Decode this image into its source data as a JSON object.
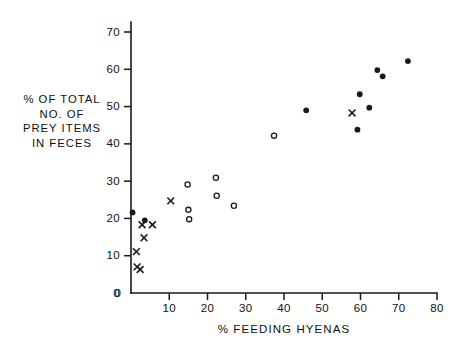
{
  "chart_data": {
    "type": "scatter",
    "title": "",
    "xlabel": "% FEEDING HYENAS",
    "ylabel_lines": [
      "% OF TOTAL",
      "NO. OF",
      "PREY ITEMS",
      "IN FECES"
    ],
    "ylabel": "% OF TOTAL NO. OF PREY ITEMS IN FECES",
    "xlim": [
      0,
      80
    ],
    "ylim": [
      0,
      73
    ],
    "xticks": [
      0,
      10,
      20,
      30,
      40,
      50,
      60,
      70,
      80
    ],
    "xtick_labels": [
      "0",
      "10",
      "20",
      "30",
      "40",
      "50",
      "60",
      "70",
      "80"
    ],
    "yticks": [
      0,
      10,
      20,
      30,
      40,
      50,
      60,
      70
    ],
    "ytick_labels": [
      "0",
      "10",
      "20",
      "30",
      "40",
      "50",
      "60",
      "70"
    ],
    "grid": false,
    "legend": null,
    "series": [
      {
        "name": "filled-circle",
        "marker": "filled-circle",
        "points": [
          [
            0.4,
            21.6
          ],
          [
            3.6,
            19.5
          ],
          [
            45.8,
            49.0
          ],
          [
            59.2,
            43.8
          ],
          [
            59.8,
            53.3
          ],
          [
            62.3,
            49.7
          ],
          [
            64.4,
            59.8
          ],
          [
            65.8,
            58.1
          ],
          [
            72.4,
            62.2
          ]
        ]
      },
      {
        "name": "open-circle",
        "marker": "open-circle",
        "points": [
          [
            14.8,
            29.1
          ],
          [
            15.0,
            22.3
          ],
          [
            15.2,
            19.8
          ],
          [
            22.2,
            30.9
          ],
          [
            22.4,
            26.1
          ],
          [
            26.9,
            23.4
          ],
          [
            37.4,
            42.2
          ]
        ]
      },
      {
        "name": "cross",
        "marker": "cross",
        "points": [
          [
            10.4,
            24.7
          ],
          [
            2.9,
            18.3
          ],
          [
            5.6,
            18.3
          ],
          [
            3.4,
            14.8
          ],
          [
            1.4,
            11.1
          ],
          [
            1.6,
            7.0
          ],
          [
            2.4,
            6.3
          ],
          [
            57.8,
            48.3
          ]
        ]
      }
    ]
  },
  "colors": {
    "ink": "#1a1a1a",
    "background": "#ffffff"
  }
}
